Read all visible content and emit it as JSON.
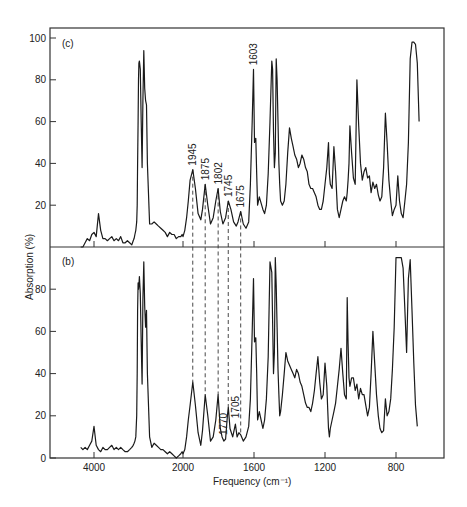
{
  "chart_data": {
    "type": "line",
    "title": "",
    "xlabel": "Frequency (cm⁻¹)",
    "ylabel": "Absorption (%)",
    "x_direction": "decreasing",
    "x_scale_note": "non-linear: compressed above 2000 cm-1",
    "xticks": [
      4000,
      2000,
      1600,
      1200,
      800
    ],
    "grid": false,
    "legend": null,
    "panels": [
      {
        "label": "(c)",
        "ylim": [
          0,
          100
        ],
        "yticks": [
          20,
          40,
          60,
          80,
          100
        ],
        "series": {
          "name": "spectrum (c)",
          "x": [
            4300,
            4250,
            4200,
            4150,
            4100,
            4050,
            4000,
            3950,
            3900,
            3850,
            3800,
            3750,
            3700,
            3650,
            3600,
            3550,
            3500,
            3450,
            3400,
            3350,
            3300,
            3250,
            3200,
            3150,
            3120,
            3100,
            3080,
            3060,
            3040,
            3030,
            3020,
            3010,
            3000,
            2990,
            2980,
            2960,
            2940,
            2920,
            2900,
            2880,
            2860,
            2840,
            2820,
            2800,
            2750,
            2700,
            2650,
            2600,
            2550,
            2500,
            2450,
            2400,
            2350,
            2300,
            2250,
            2200,
            2150,
            2100,
            2050,
            2020,
            2000,
            1990,
            1980,
            1970,
            1960,
            1945,
            1930,
            1915,
            1900,
            1890,
            1875,
            1860,
            1845,
            1830,
            1815,
            1802,
            1790,
            1775,
            1760,
            1745,
            1730,
            1715,
            1700,
            1690,
            1675,
            1660,
            1645,
            1630,
            1620,
            1610,
            1603,
            1597,
            1590,
            1585,
            1580,
            1570,
            1560,
            1550,
            1540,
            1530,
            1520,
            1510,
            1500,
            1495,
            1490,
            1485,
            1480,
            1475,
            1470,
            1465,
            1460,
            1455,
            1450,
            1440,
            1430,
            1420,
            1410,
            1400,
            1390,
            1380,
            1370,
            1360,
            1350,
            1340,
            1330,
            1320,
            1310,
            1300,
            1290,
            1280,
            1270,
            1260,
            1250,
            1240,
            1230,
            1220,
            1210,
            1200,
            1190,
            1180,
            1175,
            1170,
            1160,
            1150,
            1140,
            1130,
            1120,
            1110,
            1100,
            1090,
            1080,
            1075,
            1070,
            1065,
            1060,
            1050,
            1040,
            1030,
            1020,
            1010,
            1000,
            990,
            980,
            970,
            960,
            950,
            940,
            930,
            920,
            910,
            900,
            890,
            880,
            870,
            860,
            850,
            840,
            830,
            820,
            810,
            800,
            790,
            780,
            770,
            760,
            750,
            740,
            730,
            720,
            710,
            700,
            690,
            680,
            670
          ],
          "y": [
            0,
            0,
            2,
            4,
            3,
            6,
            7,
            5,
            16,
            8,
            4,
            4,
            3,
            4,
            5,
            3,
            4,
            3,
            5,
            2,
            2,
            3,
            2,
            1,
            3,
            4,
            6,
            8,
            12,
            20,
            40,
            60,
            80,
            88,
            89,
            85,
            60,
            38,
            70,
            94,
            76,
            70,
            68,
            40,
            11,
            11,
            12,
            11,
            10,
            9,
            8,
            7,
            5,
            7,
            6,
            6,
            4,
            5,
            5,
            6,
            5,
            8,
            14,
            22,
            32,
            37,
            28,
            16,
            13,
            18,
            30,
            20,
            11,
            14,
            22,
            28,
            17,
            11,
            14,
            22,
            18,
            12,
            10,
            12,
            17,
            11,
            9,
            12,
            30,
            60,
            85,
            50,
            52,
            35,
            20,
            24,
            21,
            18,
            16,
            20,
            35,
            60,
            89,
            85,
            55,
            38,
            45,
            90,
            80,
            60,
            40,
            30,
            22,
            20,
            22,
            30,
            45,
            57,
            52,
            48,
            44,
            42,
            38,
            40,
            44,
            42,
            38,
            36,
            30,
            28,
            28,
            26,
            24,
            20,
            18,
            18,
            22,
            30,
            38,
            50,
            35,
            30,
            28,
            48,
            36,
            18,
            14,
            18,
            22,
            24,
            22,
            26,
            32,
            40,
            58,
            45,
            33,
            30,
            80,
            58,
            40,
            32,
            36,
            38,
            33,
            34,
            26,
            31,
            28,
            30,
            25,
            22,
            24,
            38,
            64,
            50,
            32,
            22,
            15,
            18,
            20,
            34,
            22,
            16,
            14,
            22,
            30,
            50,
            90,
            98,
            98,
            97,
            88,
            60,
            35,
            80,
            96,
            70,
            40,
            25,
            10
          ]
        },
        "annotations": [
          {
            "text": "1945",
            "x": 1945
          },
          {
            "text": "1875",
            "x": 1875
          },
          {
            "text": "1802",
            "x": 1802
          },
          {
            "text": "1745",
            "x": 1745
          },
          {
            "text": "1675",
            "x": 1675
          },
          {
            "text": "1603",
            "x": 1603
          }
        ]
      },
      {
        "label": "(b)",
        "ylim": [
          0,
          95
        ],
        "yticks": [
          0,
          20,
          40,
          60,
          80
        ],
        "series": {
          "name": "spectrum (b)",
          "x": [
            4300,
            4250,
            4200,
            4150,
            4100,
            4050,
            4000,
            3950,
            3900,
            3850,
            3800,
            3750,
            3700,
            3650,
            3600,
            3550,
            3500,
            3450,
            3400,
            3350,
            3300,
            3250,
            3200,
            3150,
            3120,
            3100,
            3080,
            3060,
            3040,
            3030,
            3020,
            3010,
            3000,
            2990,
            2980,
            2960,
            2940,
            2920,
            2900,
            2880,
            2860,
            2840,
            2820,
            2800,
            2750,
            2700,
            2650,
            2600,
            2550,
            2500,
            2450,
            2400,
            2350,
            2300,
            2250,
            2200,
            2150,
            2100,
            2050,
            2020,
            2000,
            1990,
            1980,
            1970,
            1960,
            1945,
            1930,
            1915,
            1900,
            1890,
            1875,
            1860,
            1845,
            1830,
            1815,
            1802,
            1790,
            1780,
            1770,
            1760,
            1750,
            1745,
            1735,
            1720,
            1705,
            1695,
            1685,
            1675,
            1660,
            1645,
            1630,
            1620,
            1610,
            1603,
            1597,
            1590,
            1585,
            1580,
            1570,
            1560,
            1550,
            1540,
            1530,
            1520,
            1510,
            1500,
            1495,
            1490,
            1485,
            1480,
            1475,
            1470,
            1465,
            1460,
            1455,
            1450,
            1440,
            1430,
            1420,
            1410,
            1400,
            1390,
            1380,
            1370,
            1360,
            1350,
            1340,
            1330,
            1320,
            1310,
            1300,
            1290,
            1280,
            1270,
            1260,
            1250,
            1240,
            1230,
            1220,
            1210,
            1200,
            1190,
            1180,
            1175,
            1170,
            1160,
            1150,
            1140,
            1130,
            1120,
            1110,
            1100,
            1090,
            1080,
            1075,
            1070,
            1065,
            1060,
            1050,
            1040,
            1030,
            1020,
            1010,
            1000,
            990,
            980,
            970,
            960,
            950,
            940,
            930,
            920,
            910,
            900,
            890,
            880,
            870,
            860,
            850,
            840,
            830,
            820,
            810,
            800,
            790,
            780,
            770,
            760,
            750,
            740,
            730,
            720,
            710,
            700,
            690,
            680,
            670
          ],
          "y": [
            5,
            4,
            5,
            4,
            6,
            8,
            15,
            6,
            4,
            3,
            5,
            4,
            4,
            5,
            6,
            4,
            5,
            4,
            5,
            4,
            3,
            3,
            4,
            5,
            6,
            7,
            8,
            10,
            20,
            40,
            70,
            83,
            80,
            82,
            86,
            78,
            55,
            35,
            75,
            93,
            72,
            62,
            70,
            40,
            10,
            5,
            7,
            6,
            5,
            4,
            4,
            3,
            2,
            3,
            2,
            1,
            0,
            1,
            2,
            3,
            2,
            4,
            10,
            18,
            25,
            36,
            25,
            12,
            6,
            13,
            30,
            20,
            8,
            10,
            18,
            30,
            14,
            10,
            8,
            9,
            20,
            24,
            14,
            10,
            16,
            10,
            12,
            11,
            8,
            10,
            15,
            28,
            60,
            85,
            55,
            57,
            40,
            18,
            22,
            18,
            14,
            18,
            28,
            48,
            93,
            88,
            65,
            40,
            50,
            95,
            82,
            62,
            42,
            30,
            20,
            22,
            30,
            40,
            50,
            46,
            44,
            42,
            40,
            38,
            42,
            40,
            36,
            34,
            30,
            26,
            24,
            24,
            22,
            26,
            32,
            40,
            48,
            36,
            28,
            30,
            45,
            34,
            14,
            10,
            14,
            18,
            22,
            26,
            34,
            42,
            52,
            40,
            30,
            28,
            76,
            54,
            38,
            34,
            38,
            38,
            32,
            35,
            28,
            33,
            30,
            30,
            25,
            20,
            24,
            40,
            60,
            45,
            30,
            20,
            14,
            12,
            13,
            28,
            20,
            22,
            28,
            42,
            62,
            95,
            95,
            95,
            95,
            90,
            70,
            50,
            85,
            94,
            70,
            45,
            25,
            15
          ]
        },
        "annotations": [
          {
            "text": "1770",
            "x": 1770
          },
          {
            "text": "1705",
            "x": 1705
          }
        ]
      }
    ],
    "dashed_connectors": [
      1945,
      1875,
      1802,
      1745,
      1675
    ]
  },
  "labels": {
    "panel_c": "(c)",
    "panel_b": "(b)",
    "ylabel": "Absorption (%)",
    "xlabel": "Frequency (cm⁻¹)"
  }
}
